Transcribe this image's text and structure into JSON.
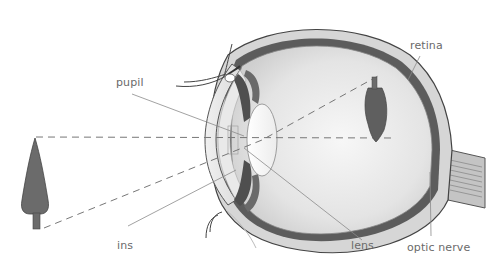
{
  "diagram": {
    "type": "anatomy",
    "labels": {
      "pupil": "pupil",
      "retina": "retina",
      "iris": "ins",
      "lens": "lens",
      "optic_nerve": "optic nerve"
    },
    "objects": {
      "real_tree": "upright tree (object)",
      "retinal_image": "inverted tree image on retina"
    },
    "colors": {
      "label_text": "#6a6a6a",
      "leader_line": "#8a8a8a",
      "tree_fill": "#6b6b6b",
      "sclera_outline": "#4a4a4a",
      "choroid": "#5a5a5a",
      "dashed_ray": "#777777",
      "background": "#ffffff"
    }
  }
}
